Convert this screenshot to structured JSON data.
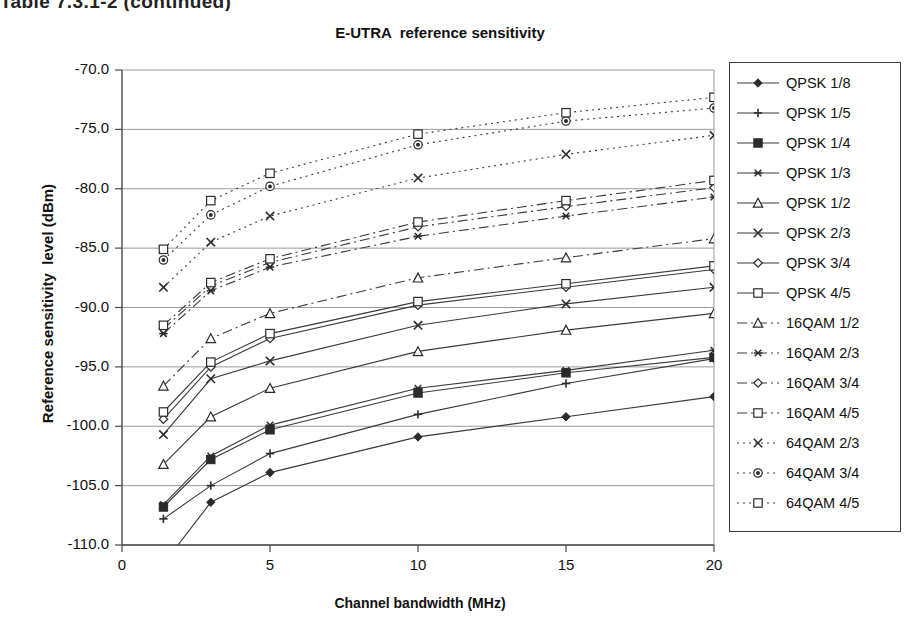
{
  "page": {
    "top_caption": "Table 7.3.1-2 (continued)"
  },
  "chart_data": {
    "type": "line",
    "title": "E-UTRA  reference sensitivity",
    "xlabel": "Channel bandwidth (MHz)",
    "ylabel": "Reference sensitivity  level (dBm)",
    "xlim": [
      0,
      20
    ],
    "ylim": [
      -110.0,
      -70.0
    ],
    "xticks": [
      0,
      5,
      10,
      15,
      20
    ],
    "xtick_labels": [
      "0",
      "5",
      "10",
      "15",
      "20"
    ],
    "yticks": [
      -70.0,
      -75.0,
      -80.0,
      -85.0,
      -90.0,
      -95.0,
      -100.0,
      -105.0,
      -110.0
    ],
    "ytick_labels": [
      "-70.0",
      "-75.0",
      "-80.0",
      "-85.0",
      "-90.0",
      "-95.0",
      "-100.0",
      "-105.0",
      "-110.0"
    ],
    "grid": true,
    "legend_position": "right",
    "x": [
      1.4,
      3,
      5,
      10,
      15,
      20
    ],
    "series": [
      {
        "name": "QPSK 1/8",
        "marker": "filled-diamond",
        "dash": "solid",
        "values": [
          -111.6,
          -106.4,
          -103.9,
          -100.9,
          -99.2,
          -97.5
        ]
      },
      {
        "name": "QPSK 1/5",
        "marker": "plus",
        "dash": "solid",
        "values": [
          -107.8,
          -105.0,
          -102.3,
          -99.0,
          -96.4,
          -94.3
        ]
      },
      {
        "name": "QPSK 1/4",
        "marker": "filled-square",
        "dash": "solid",
        "values": [
          -106.8,
          -102.8,
          -100.3,
          -97.2,
          -95.5,
          -94.2
        ]
      },
      {
        "name": "QPSK 1/3",
        "marker": "star",
        "dash": "solid",
        "values": [
          -106.6,
          -102.5,
          -99.9,
          -96.8,
          -95.3,
          -93.6
        ]
      },
      {
        "name": "QPSK 1/2",
        "marker": "open-triangle",
        "dash": "solid",
        "values": [
          -103.2,
          -99.2,
          -96.8,
          -93.7,
          -91.9,
          -90.5
        ]
      },
      {
        "name": "QPSK 2/3",
        "marker": "x",
        "dash": "solid",
        "values": [
          -100.7,
          -96.0,
          -94.5,
          -91.5,
          -89.7,
          -88.3
        ]
      },
      {
        "name": "QPSK 3/4",
        "marker": "open-diamond",
        "dash": "solid",
        "values": [
          -99.4,
          -95.0,
          -92.6,
          -89.8,
          -88.3,
          -86.8
        ]
      },
      {
        "name": "QPSK 4/5",
        "marker": "open-square",
        "dash": "solid",
        "values": [
          -98.8,
          -94.6,
          -92.2,
          -89.5,
          -88.0,
          -86.5
        ]
      },
      {
        "name": "16QAM 1/2",
        "marker": "open-triangle",
        "dash": "dashdot",
        "values": [
          -96.6,
          -92.6,
          -90.5,
          -87.5,
          -85.8,
          -84.2
        ]
      },
      {
        "name": "16QAM 2/3",
        "marker": "star",
        "dash": "dashdot",
        "values": [
          -92.2,
          -88.6,
          -86.6,
          -84.0,
          -82.3,
          -80.7
        ]
      },
      {
        "name": "16QAM 3/4",
        "marker": "open-diamond",
        "dash": "dashdot",
        "values": [
          -91.8,
          -88.2,
          -86.2,
          -83.2,
          -81.5,
          -79.9
        ]
      },
      {
        "name": "16QAM 4/5",
        "marker": "open-square",
        "dash": "dashdot",
        "values": [
          -91.5,
          -87.9,
          -85.9,
          -82.8,
          -81.0,
          -79.3
        ]
      },
      {
        "name": "64QAM 2/3",
        "marker": "x",
        "dash": "dotted",
        "values": [
          -88.3,
          -84.5,
          -82.3,
          -79.1,
          -77.1,
          -75.5
        ]
      },
      {
        "name": "64QAM 3/4",
        "marker": "open-circle",
        "dash": "dotted",
        "values": [
          -86.0,
          -82.2,
          -79.8,
          -76.3,
          -74.3,
          -73.2
        ]
      },
      {
        "name": "64QAM 4/5",
        "marker": "open-square",
        "dash": "dotted",
        "values": [
          -85.1,
          -81.0,
          -78.7,
          -75.4,
          -73.6,
          -72.3
        ]
      }
    ]
  }
}
